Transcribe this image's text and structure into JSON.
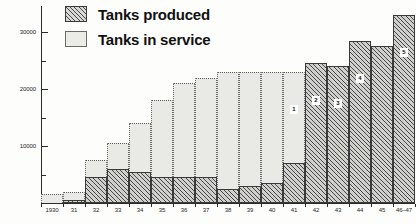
{
  "legend": {
    "position": "top-left",
    "items": [
      {
        "label": "Tanks produced",
        "pattern": "diagonal-hatch",
        "color": "#4a4a4a"
      },
      {
        "label": "Tanks in service",
        "pattern": "solid-light",
        "color": "#e9e9e6"
      }
    ]
  },
  "axes": {
    "y_ticks_major": [
      "30000",
      "20000",
      "10000"
    ],
    "y_minor_count": 3
  },
  "footnote_markers": [
    {
      "year": "41",
      "marker": "1"
    },
    {
      "year": "42",
      "marker": "2"
    },
    {
      "year": "43",
      "marker": "3"
    },
    {
      "year": "44",
      "marker": "4"
    },
    {
      "year": "46-47",
      "marker": "5"
    }
  ],
  "chart_data": {
    "type": "bar",
    "title": "",
    "subtitle": "",
    "xlabel": "",
    "ylabel": "",
    "ylim": [
      0,
      35000
    ],
    "yticks": [
      0,
      5000,
      10000,
      15000,
      20000,
      25000,
      30000
    ],
    "ytick_labels": [
      "",
      "",
      "10000",
      "",
      "20000",
      "",
      "30000"
    ],
    "grid": false,
    "stacking": "overlay",
    "categories": [
      "1930",
      "31",
      "32",
      "33",
      "34",
      "35",
      "36",
      "37",
      "38",
      "39",
      "40",
      "41",
      "42",
      "43",
      "44",
      "45",
      "46-47"
    ],
    "series": [
      {
        "name": "Tanks produced",
        "pattern": "diagonal-hatch",
        "values": [
          0,
          500,
          4500,
          6000,
          5500,
          4500,
          4500,
          4500,
          2500,
          3000,
          3500,
          7000,
          24500,
          24000,
          28500,
          27500,
          33000
        ]
      },
      {
        "name": "Tanks in service",
        "pattern": "solid-light",
        "values": [
          1500,
          2000,
          7500,
          10500,
          14000,
          18000,
          21000,
          22000,
          23000,
          23000,
          23000,
          23000,
          0,
          0,
          0,
          0,
          0
        ]
      }
    ]
  },
  "caption": ""
}
